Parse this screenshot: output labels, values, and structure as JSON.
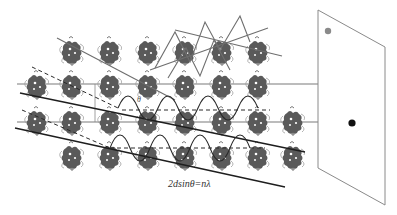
{
  "diagram": {
    "formula": "2dsinθ=nλ",
    "angle_label": "θ",
    "colors": {
      "molecule": "#5a5a5a",
      "molecule_outline": "#9a9a9a",
      "lattice_line": "#777777",
      "ray": "#222222",
      "incident_wave": "#6e6e6e",
      "detector_edge": "#8a8a8a",
      "spot_strong": "#111111",
      "spot_weak": "#8a8a8a"
    },
    "lattice": {
      "rows": [
        {
          "y": 52,
          "x": [
            72,
            110,
            148,
            185,
            222,
            258
          ]
        },
        {
          "y": 86,
          "x": [
            37,
            72,
            110,
            148,
            185,
            222,
            258
          ]
        },
        {
          "y": 122,
          "x": [
            37,
            72,
            110,
            148,
            185,
            222,
            258,
            293
          ]
        },
        {
          "y": 157,
          "x": [
            72,
            110,
            148,
            185,
            222,
            258,
            293
          ]
        }
      ],
      "planes_y": [
        84,
        122
      ]
    },
    "detector": {
      "label": "detector screen",
      "corners": [
        [
          318,
          10
        ],
        [
          385,
          47
        ],
        [
          385,
          205
        ],
        [
          318,
          168
        ]
      ],
      "spots": [
        {
          "x": 328,
          "y": 31,
          "r": 3.2,
          "type": "weak"
        },
        {
          "x": 352,
          "y": 123,
          "r": 3.6,
          "type": "strong"
        }
      ]
    }
  }
}
